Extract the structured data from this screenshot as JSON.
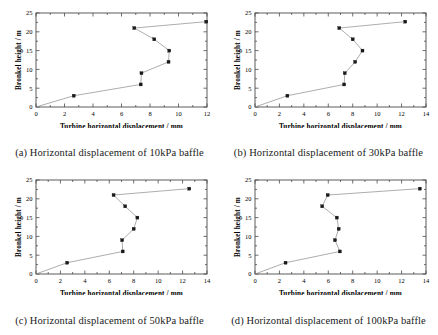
{
  "figure": {
    "panels": [
      {
        "id": "a",
        "caption": "(a) Horizontal displacement of 10kPa baffle",
        "xlabel": "Turbine horizontal displacement  /  mm",
        "ylabel": "Bronkel height  /  m",
        "xticks": [
          0,
          2,
          4,
          6,
          8,
          10,
          12
        ],
        "yticks": [
          0,
          5,
          10,
          15,
          20,
          25
        ],
        "xlim": [
          0,
          12
        ],
        "ylim": [
          0,
          25
        ]
      },
      {
        "id": "b",
        "caption": "(b) Horizontal displacement of 30kPa baffle",
        "xlabel": "Turbine horizontal displacement  /  mm",
        "ylabel": "Bronkel height  /  m",
        "xticks": [
          0,
          2,
          4,
          6,
          8,
          10,
          12,
          14
        ],
        "yticks": [
          0,
          5,
          10,
          15,
          20,
          25
        ],
        "xlim": [
          0,
          14
        ],
        "ylim": [
          0,
          25
        ]
      },
      {
        "id": "c",
        "caption": "(c) Horizontal displacement of 50kPa baffle",
        "xlabel": "Turbine horizontal displacement  /  mm",
        "ylabel": "Bronkel height  /  m",
        "xticks": [
          0,
          2,
          4,
          6,
          8,
          10,
          12,
          14
        ],
        "yticks": [
          0,
          5,
          10,
          15,
          20,
          25
        ],
        "xlim": [
          0,
          14
        ],
        "ylim": [
          0,
          25
        ]
      },
      {
        "id": "d",
        "caption": "(d) Horizontal displacement of 100kPa baffle",
        "xlabel": "Turbine horizontal displacement  /  mm",
        "ylabel": "Bronkel height  /  m",
        "xticks": [
          0,
          2,
          4,
          6,
          8,
          10,
          12,
          14
        ],
        "yticks": [
          0,
          5,
          10,
          15,
          20,
          25
        ],
        "xlim": [
          0,
          14
        ],
        "ylim": [
          0,
          25
        ]
      }
    ]
  },
  "chart_data": [
    {
      "type": "line",
      "panel": "a",
      "title": "(a) Horizontal displacement of 10kPa baffle",
      "xlabel": "Turbine horizontal displacement / mm",
      "ylabel": "Bronkel height / m",
      "xlim": [
        0,
        12
      ],
      "ylim": [
        0,
        25
      ],
      "xticks": [
        0,
        2,
        4,
        6,
        8,
        10,
        12
      ],
      "yticks": [
        0,
        5,
        10,
        15,
        20,
        25
      ],
      "grid": false,
      "legend": "none",
      "series": [
        {
          "name": "10kPa baffle",
          "x": [
            0.0,
            2.65,
            7.35,
            7.4,
            9.3,
            9.35,
            8.3,
            6.9,
            11.95
          ],
          "y": [
            0.0,
            3.0,
            6.0,
            9.0,
            12.0,
            15.0,
            18.0,
            21.0,
            22.7
          ]
        }
      ]
    },
    {
      "type": "line",
      "panel": "b",
      "title": "(b) Horizontal displacement of 30kPa baffle",
      "xlabel": "Turbine horizontal displacement / mm",
      "ylabel": "Bronkel height / m",
      "xlim": [
        0,
        14
      ],
      "ylim": [
        0,
        25
      ],
      "xticks": [
        0,
        2,
        4,
        6,
        8,
        10,
        12,
        14
      ],
      "yticks": [
        0,
        5,
        10,
        15,
        20,
        25
      ],
      "grid": false,
      "legend": "none",
      "series": [
        {
          "name": "30kPa baffle",
          "x": [
            0.0,
            2.65,
            7.3,
            7.35,
            8.2,
            8.8,
            8.0,
            6.9,
            12.3
          ],
          "y": [
            0.0,
            3.0,
            6.0,
            9.0,
            12.0,
            15.0,
            18.0,
            21.0,
            22.7
          ]
        }
      ]
    },
    {
      "type": "line",
      "panel": "c",
      "title": "(c) Horizontal displacement of 50kPa baffle",
      "xlabel": "Turbine horizontal displacement / mm",
      "ylabel": "Bronkel height / m",
      "xlim": [
        0,
        14
      ],
      "ylim": [
        0,
        25
      ],
      "xticks": [
        0,
        2,
        4,
        6,
        8,
        10,
        12,
        14
      ],
      "yticks": [
        0,
        5,
        10,
        15,
        20,
        25
      ],
      "grid": false,
      "legend": "none",
      "series": [
        {
          "name": "50kPa baffle",
          "x": [
            0.0,
            2.55,
            7.1,
            7.05,
            8.0,
            8.3,
            7.3,
            6.35,
            12.55
          ],
          "y": [
            0.0,
            3.0,
            6.0,
            9.0,
            12.0,
            15.0,
            18.0,
            21.0,
            22.7
          ]
        }
      ]
    },
    {
      "type": "line",
      "panel": "d",
      "title": "(d) Horizontal displacement of 100kPa baffle",
      "xlabel": "Turbine horizontal displacement / mm",
      "ylabel": "Bronkel height / m",
      "xlim": [
        0,
        14
      ],
      "ylim": [
        0,
        25
      ],
      "xticks": [
        0,
        2,
        4,
        6,
        8,
        10,
        12,
        14
      ],
      "yticks": [
        0,
        5,
        10,
        15,
        20,
        25
      ],
      "grid": false,
      "legend": "none",
      "series": [
        {
          "name": "100kPa baffle",
          "x": [
            0.0,
            2.5,
            6.95,
            6.55,
            6.85,
            6.7,
            5.5,
            5.95,
            13.5
          ],
          "y": [
            0.0,
            3.0,
            6.0,
            9.0,
            12.0,
            15.0,
            18.0,
            21.0,
            22.7
          ]
        }
      ]
    }
  ]
}
